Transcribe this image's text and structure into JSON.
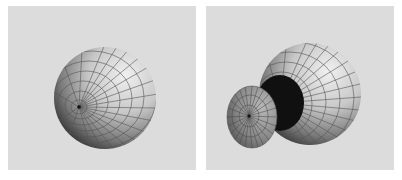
{
  "figure": {
    "panels": [
      {
        "id": "left",
        "subject": "sphere-mesh",
        "background": "#dcdcdc",
        "sphere": {
          "cx": 97,
          "cy": 92,
          "r": 51,
          "pole_x": 71,
          "pole_y": 101
        }
      },
      {
        "id": "right",
        "subject": "sphere-mesh-with-detached-cap",
        "background": "#dcdcdc",
        "sphere": {
          "cx": 104,
          "cy": 88,
          "r": 51
        },
        "hole": {
          "cx": 74,
          "cy": 97,
          "rx": 24,
          "ry": 28
        },
        "cap": {
          "cx": 46,
          "cy": 111,
          "rx": 25,
          "ry": 31,
          "pole_x": 43,
          "pole_y": 110
        }
      }
    ],
    "colors": {
      "sphere_light": "#ececec",
      "sphere_mid": "#a8a8a8",
      "sphere_dark": "#3a3a3a",
      "grid_line": "#555555",
      "hole": "#101010"
    }
  }
}
